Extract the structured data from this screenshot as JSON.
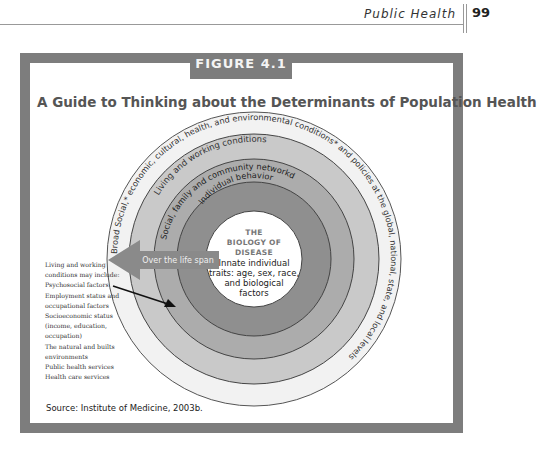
{
  "running_head": {
    "section": "Public Health",
    "page_number": "99"
  },
  "figure": {
    "label": "FIGURE 4.1",
    "title": "A Guide to Thinking about the Determinants of Population Health",
    "rings": [
      {
        "label": "Broad Social,* economic, cultural, health, and environmental conditions* and policies at the global, national, state, and local levels",
        "fill": "#f2f2f2"
      },
      {
        "label": "Living and working conditions",
        "fill": "#c9c9c9"
      },
      {
        "label": "Social, family and community networkd",
        "fill": "#acacac"
      },
      {
        "label": "Individual behavior",
        "fill": "#8f8f8f"
      }
    ],
    "center": {
      "heading_lines": [
        "THE",
        "BIOLOGY OF",
        "DISEASE"
      ],
      "body_lines": [
        "Innate individual",
        "traits: age, sex, race,",
        "and biological",
        "factors"
      ]
    },
    "arrow_label": "Over the life span",
    "legend": {
      "lines": [
        "Living and working",
        "conditions may include:",
        "Psychosocial factors",
        "Employment status and",
        "occupational factors",
        "Socioeconomic status",
        "(income, education,",
        "occupation)",
        "The natural and builts",
        "environments",
        "Public health services",
        "Health care services"
      ]
    },
    "source": "Source: Institute of Medicine, 2003b."
  },
  "colors": {
    "frame": "#7d7d7d",
    "arrow": "#8a8a8a",
    "ring_stroke": "#444444"
  }
}
